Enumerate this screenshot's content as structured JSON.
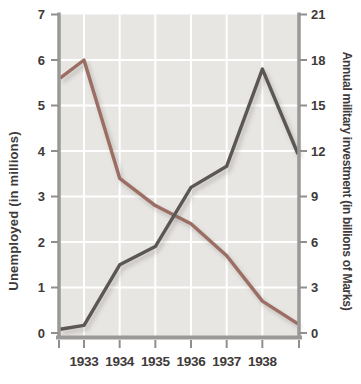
{
  "chart_data": {
    "type": "line",
    "title": "",
    "grid": true,
    "legend": "none",
    "colors": {
      "plot_background": "#e8e6e3",
      "grid_line": "#ffffff",
      "axis_line": "#9b9997",
      "tick_mark": "#918f8d",
      "label_text": "#3e3a39",
      "unemployed_line": "#9c6e64",
      "military_line": "#5c5755"
    },
    "left_axis": {
      "label": "Unemployed (in millions)",
      "min": 0,
      "max": 7,
      "tick_labels": [
        "0",
        "1",
        "2",
        "3",
        "4",
        "5",
        "6",
        "7"
      ]
    },
    "right_axis": {
      "label": "Annual military investment (in billions of Marks)",
      "min": 0,
      "max": 21,
      "tick_labels": [
        "0",
        "3",
        "6",
        "9",
        "12",
        "15",
        "18",
        "21"
      ]
    },
    "x_axis": {
      "tick_labels": [
        "1933",
        "1934",
        "1935",
        "1936",
        "1937",
        "1938"
      ]
    },
    "series": [
      {
        "name": "unemployed",
        "axis": "left",
        "units": "millions",
        "color": "#9c6e64",
        "x": [
          1932.33,
          1933,
          1934,
          1935,
          1936,
          1937,
          1938,
          1939
        ],
        "values": [
          5.6,
          6.0,
          3.4,
          2.8,
          2.4,
          1.7,
          0.7,
          0.2
        ]
      },
      {
        "name": "military-investment",
        "axis": "right",
        "units": "billions of Marks",
        "color": "#5c5755",
        "x": [
          1932.33,
          1933,
          1934,
          1935,
          1936,
          1937,
          1938,
          1939
        ],
        "values": [
          0.25,
          0.5,
          4.5,
          5.7,
          9.6,
          11.0,
          17.4,
          11.8
        ]
      }
    ]
  }
}
